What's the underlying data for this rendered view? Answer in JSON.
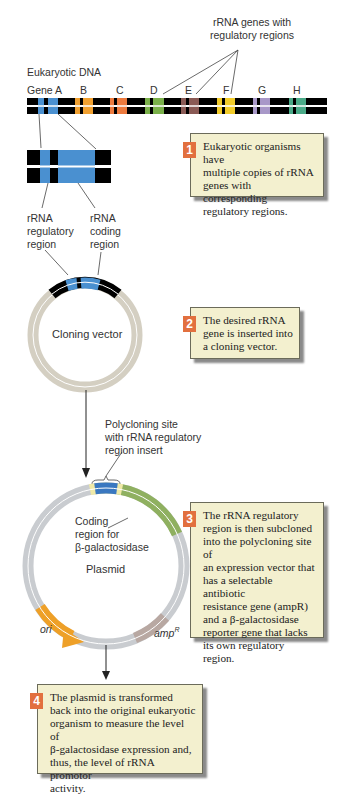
{
  "labels": {
    "rrna_genes": "rRNA genes with\nregulatory regions",
    "eukaryotic_dna": "Eukaryotic DNA",
    "genes": [
      "Gene A",
      "B",
      "C",
      "D",
      "E",
      "F",
      "G",
      "H"
    ],
    "regulatory_region": "rRNA\nregulatory\nregion",
    "coding_region": "rRNA\ncoding\nregion",
    "cloning_vector": "Cloning vector",
    "polycloning_site": "Polycloning site\nwith rRNA regulatory\nregion insert",
    "coding_beta_gal": "Coding\nregion for\nβ-galactosidase",
    "plasmid": "Plasmid",
    "ori": "ori",
    "amp": "amp",
    "amp_sup": "R"
  },
  "steps": [
    {
      "num": "1",
      "text": "Eukaryotic organisms have\nmultiple copies of rRNA\ngenes with corresponding\nregulatory regions."
    },
    {
      "num": "2",
      "text": "The desired rRNA\ngene is inserted into\na cloning vector."
    },
    {
      "num": "3",
      "text": "The rRNA regulatory\nregion is then subcloned\ninto the polycloning site of\nan expression vector that\nhas a selectable antibiotic\nresistance gene (ampR)\nand a β-galactosidase\nreporter gene that lacks\nits own regulatory region."
    },
    {
      "num": "4",
      "text": "The plasmid is transformed\nback into the original eukaryotic\norganism to measure the level of\nβ-galactosidase expression and,\nthus, the level of rRNA promotor\nactivity."
    }
  ],
  "colors": {
    "gene_a": "#4a90d0",
    "gene_b": "#f0a030",
    "gene_c": "#ec7a3e",
    "gene_d": "#7ab04a",
    "gene_e": "#8a5a55",
    "gene_f": "#f2cc2a",
    "gene_g": "#a898c8",
    "gene_h": "#4aaa88",
    "vector": "#d4cfc2",
    "plasmid": "#c9ccd0",
    "lacz": "#8fb060",
    "ori": "#eea028",
    "amp": "#b8a8a2",
    "badge": "#e2703f",
    "box_bg": "#f3f0cf"
  }
}
